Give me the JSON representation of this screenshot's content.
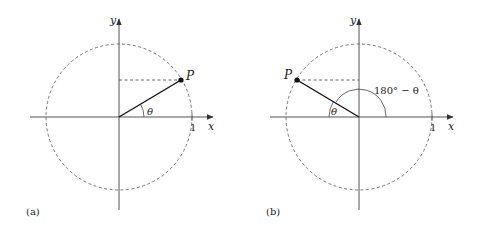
{
  "panels": [
    {
      "id": "a",
      "caption": "(a)",
      "x_label": "x",
      "y_label": "y",
      "point_label": "P",
      "angle_label": "θ",
      "tick_label": "1"
    },
    {
      "id": "b",
      "caption": "(b)",
      "x_label": "x",
      "y_label": "y",
      "point_label": "P",
      "angle_label": "θ",
      "supplement_label": "180° − θ",
      "tick_label": "1"
    }
  ],
  "colors": {
    "axis": "#555555",
    "circle": "#555555",
    "radius": "#111111"
  }
}
